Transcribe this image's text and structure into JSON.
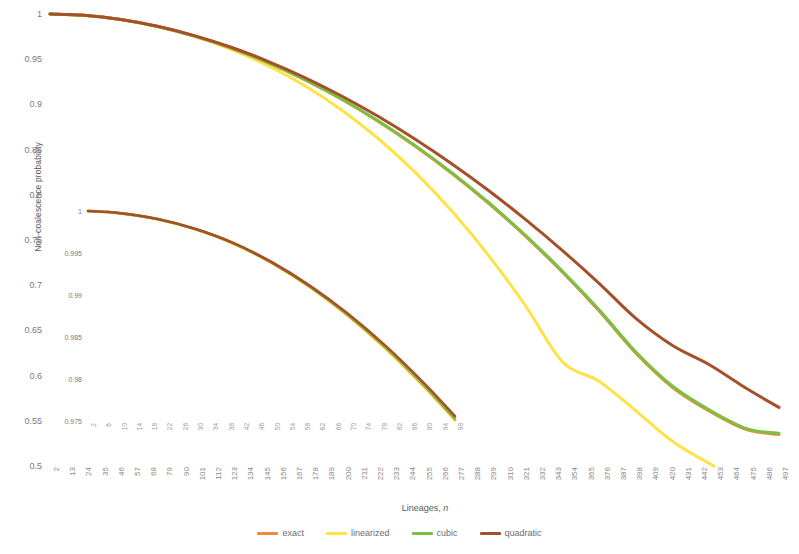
{
  "chart_data": {
    "type": "line",
    "title": "",
    "xlabel": "Lineages, n",
    "ylabel": "Non-coalescence probability",
    "grid": false,
    "legend_position": "bottom",
    "xlim": [
      2,
      497
    ],
    "ylim": [
      0.5,
      1.0
    ],
    "xticks": [
      2,
      13,
      24,
      35,
      46,
      57,
      68,
      79,
      90,
      101,
      112,
      123,
      134,
      145,
      156,
      167,
      178,
      189,
      200,
      211,
      222,
      233,
      244,
      255,
      266,
      277,
      288,
      299,
      310,
      321,
      332,
      343,
      354,
      365,
      376,
      387,
      398,
      409,
      420,
      431,
      442,
      453,
      464,
      475,
      486,
      497
    ],
    "yticks": [
      1,
      0.95,
      0.9,
      0.85,
      0.8,
      0.75,
      0.7,
      0.65,
      0.6,
      0.55,
      0.5
    ],
    "ytick_labels": [
      "1",
      "0.95",
      "0.9",
      "0.85",
      "0.8",
      "0.75",
      "0.7",
      "0.65",
      "0.6",
      "0.55",
      "0.5"
    ],
    "series": [
      {
        "name": "exact",
        "color": "#ED8B3C",
        "x": [
          2,
          25,
          50,
          75,
          100,
          125,
          150,
          175,
          200,
          225,
          250,
          275,
          300,
          325,
          350,
          375,
          400,
          425,
          450,
          475,
          497
        ],
        "y": [
          1.0,
          0.9985,
          0.9938,
          0.9862,
          0.9757,
          0.9624,
          0.9462,
          0.9273,
          0.9057,
          0.8812,
          0.8538,
          0.8236,
          0.7903,
          0.7539,
          0.7143,
          0.6712,
          0.6245,
          0.5866,
          0.5605,
          0.5402,
          0.5348
        ]
      },
      {
        "name": "linearized",
        "color": "#FFE246",
        "x": [
          2,
          25,
          50,
          75,
          100,
          125,
          150,
          175,
          200,
          225,
          250,
          275,
          300,
          325,
          350,
          375,
          400,
          425,
          453
        ],
        "y": [
          1.0,
          0.9985,
          0.9938,
          0.9861,
          0.9752,
          0.9609,
          0.9428,
          0.9206,
          0.8938,
          0.862,
          0.8248,
          0.7817,
          0.7325,
          0.677,
          0.6152,
          0.5936,
          0.5608,
          0.5268,
          0.4997
        ]
      },
      {
        "name": "cubic",
        "color": "#7BC043",
        "x": [
          2,
          25,
          50,
          75,
          100,
          125,
          150,
          175,
          200,
          225,
          250,
          275,
          300,
          325,
          350,
          375,
          400,
          425,
          450,
          475,
          497
        ],
        "y": [
          1.0,
          0.9985,
          0.9938,
          0.9862,
          0.9757,
          0.9625,
          0.9463,
          0.9275,
          0.906,
          0.8816,
          0.8544,
          0.8243,
          0.7912,
          0.755,
          0.7155,
          0.6725,
          0.6258,
          0.5879,
          0.5618,
          0.5414,
          0.536
        ]
      },
      {
        "name": "quadratic",
        "color": "#A4502B",
        "x": [
          2,
          25,
          50,
          75,
          100,
          125,
          150,
          175,
          200,
          225,
          250,
          275,
          300,
          325,
          350,
          375,
          400,
          425,
          450,
          475,
          497
        ],
        "y": [
          1.0,
          0.9985,
          0.9939,
          0.9864,
          0.9761,
          0.9632,
          0.9477,
          0.9297,
          0.9093,
          0.8866,
          0.8615,
          0.8341,
          0.8045,
          0.7725,
          0.7383,
          0.7018,
          0.663,
          0.633,
          0.6118,
          0.5857,
          0.5648
        ]
      }
    ],
    "inset": {
      "type": "line",
      "xlim": [
        2,
        98
      ],
      "ylim": [
        0.975,
        1.0
      ],
      "xticks": [
        2,
        6,
        10,
        14,
        18,
        22,
        26,
        30,
        34,
        38,
        42,
        46,
        50,
        54,
        58,
        62,
        66,
        70,
        74,
        78,
        82,
        86,
        90,
        94,
        98
      ],
      "yticks": [
        1,
        0.995,
        0.99,
        0.985,
        0.98,
        0.975
      ],
      "ytick_labels": [
        "1",
        "0.995",
        "0.99",
        "0.985",
        "0.98",
        "0.975"
      ],
      "series": [
        {
          "name": "exact",
          "color": "#ED8B3C",
          "x": [
            2,
            10,
            20,
            30,
            40,
            50,
            60,
            70,
            80,
            90,
            98
          ],
          "y": [
            1.0,
            0.99975,
            0.99905,
            0.99785,
            0.99615,
            0.99385,
            0.991,
            0.9876,
            0.98365,
            0.97915,
            0.9752
          ]
        },
        {
          "name": "linearized",
          "color": "#FFE246",
          "x": [
            2,
            10,
            20,
            30,
            40,
            50,
            60,
            70,
            80,
            90,
            98
          ],
          "y": [
            1.0,
            0.99975,
            0.99903,
            0.99782,
            0.9961,
            0.9938,
            0.99092,
            0.9875,
            0.98352,
            0.979,
            0.97505
          ]
        },
        {
          "name": "cubic",
          "color": "#7BC043",
          "x": [
            2,
            10,
            20,
            30,
            40,
            50,
            60,
            70,
            80,
            90,
            98
          ],
          "y": [
            1.0,
            0.99975,
            0.99905,
            0.99785,
            0.99616,
            0.99387,
            0.99103,
            0.98764,
            0.9837,
            0.97922,
            0.97528
          ]
        },
        {
          "name": "quadratic",
          "color": "#A4502B",
          "x": [
            2,
            10,
            20,
            30,
            40,
            50,
            60,
            70,
            80,
            90,
            98
          ],
          "y": [
            1.0,
            0.99976,
            0.99907,
            0.99788,
            0.9962,
            0.99393,
            0.99112,
            0.98777,
            0.98388,
            0.97945,
            0.97557
          ]
        }
      ]
    },
    "legend": [
      {
        "label": "exact",
        "color": "#ED8B3C"
      },
      {
        "label": "linearized",
        "color": "#FFE246"
      },
      {
        "label": "cubic",
        "color": "#7BC043"
      },
      {
        "label": "quadratic",
        "color": "#A4502B"
      }
    ]
  }
}
